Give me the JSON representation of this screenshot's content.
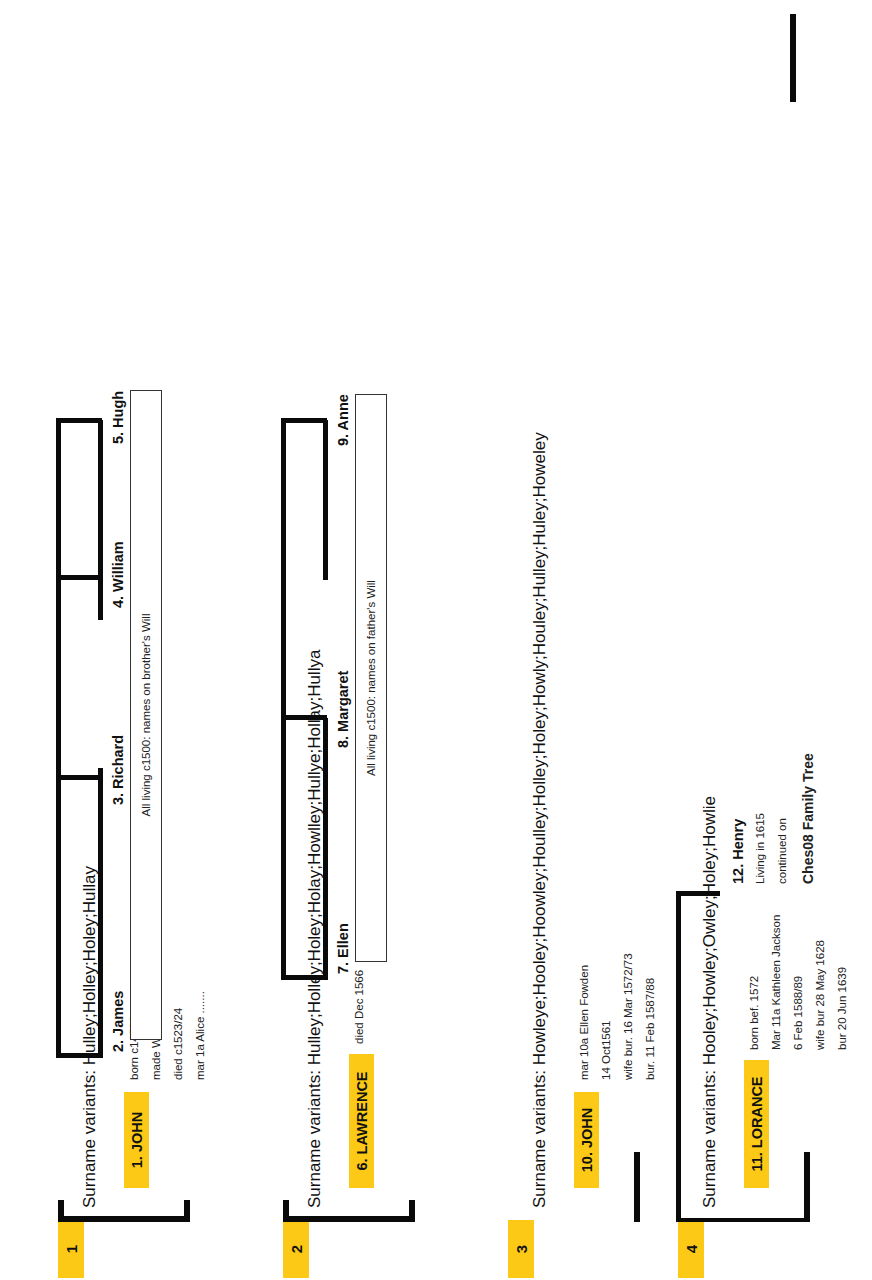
{
  "document": {
    "title": "Ches08 Family Tree",
    "accent_color": "#FBC916",
    "line_color": "#0a0a0a"
  },
  "generations": [
    {
      "index_label": "1",
      "variants_text": "Surname variants: Hulley;Holley;Holey;Hullay",
      "principal": {
        "name": "1. JOHN",
        "details": [
          "born c1450?",
          "made Will c1500",
          "died c1523/24",
          "mar 1a Alice ......."
        ]
      },
      "children": [
        {
          "name": "2. James"
        },
        {
          "name": "3. Richard"
        },
        {
          "name": "4. William"
        },
        {
          "name": "5. Hugh"
        }
      ],
      "note": "All living c1500: names on brother's Will"
    },
    {
      "index_label": "2",
      "variants_text": "Surname variants: Hulley;Holley;Holey;Holay;Howlley;Hullye;Hollay;Hullya",
      "principal": {
        "name": "6. LAWRENCE",
        "details": [
          "died Dec 1566"
        ]
      },
      "children": [
        {
          "name": "7. Ellen"
        },
        {
          "name": "8. Margaret"
        },
        {
          "name": "9. Anne"
        }
      ],
      "note": "All living c1500: names on father's Will"
    },
    {
      "index_label": "3",
      "variants_text": "Surname variants: Howleye;Hooley;Hoowley;Houlley;Holley;Holey;Howly;Houley;Hulley;Huley;Howeley",
      "principal": {
        "name": "10. JOHN",
        "details": [
          "mar 10a Ellen Fowden",
          "14 Oct1561",
          "wife bur. 16 Mar 1572/73",
          "bur. 11 Feb 1587/88"
        ]
      },
      "children": [],
      "note": ""
    },
    {
      "index_label": "4",
      "variants_text": "Surname variants: Hooley;Howley;Owley;Holey;Howlie",
      "principal": {
        "name": "11. LORANCE",
        "details": [
          "born bef. 1572",
          "Mar 11a Kathleen Jackson",
          "6 Feb 1588/89",
          "wife bur 28 May 1628",
          "bur 20 Jun 1639"
        ]
      },
      "children": [
        {
          "name": "12. Henry",
          "details": [
            "Living in 1615",
            "continued on"
          ],
          "footer": "Ches08 Family Tree"
        }
      ],
      "note": ""
    }
  ]
}
